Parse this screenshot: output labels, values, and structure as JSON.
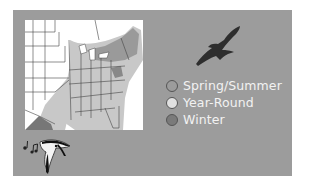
{
  "colors": {
    "panel_bg": "#9c9c9c",
    "map_bg": "#ffffff",
    "range_light": "#c4c4c4",
    "range_dark": "#8a8a8a",
    "legend_text": "#f2f2f2",
    "silhouette": "#2e2e2e"
  },
  "map": {
    "region": "Eastern United States",
    "icon": "range-map"
  },
  "legend": {
    "items": [
      {
        "label": "Spring/Summer",
        "color": "#9c9c9c"
      },
      {
        "label": "Year-Round",
        "color": "#e0e0e0"
      },
      {
        "label": "Winter",
        "color": "#7a7a7a"
      }
    ]
  },
  "icons": {
    "flight": "hawk-silhouette-icon",
    "song": "singing-bird-icon"
  }
}
